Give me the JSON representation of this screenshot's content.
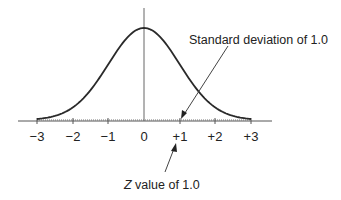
{
  "diagram": {
    "annotations": {
      "std_dev": "Standard deviation of 1.0",
      "z_italic": "Z",
      "z_rest": " value of 1.0"
    },
    "x_ticks": [
      "−3",
      "−2",
      "−1",
      "0",
      "+1",
      "+2",
      "+3"
    ]
  },
  "chart_data": {
    "type": "line",
    "title": "",
    "xlabel": "",
    "ylabel": "",
    "x_range": [
      -3,
      3
    ],
    "tick_labels": [
      "-3",
      "-2",
      "-1",
      "0",
      "+1",
      "+2",
      "+3"
    ],
    "series": [
      {
        "name": "normal curve",
        "mean": 0,
        "std": 1.0
      }
    ],
    "annotations": [
      "Standard deviation of 1.0",
      "Z value of 1.0"
    ],
    "colors": {
      "curve": "#2a2a2a",
      "axis": "#555555"
    }
  }
}
